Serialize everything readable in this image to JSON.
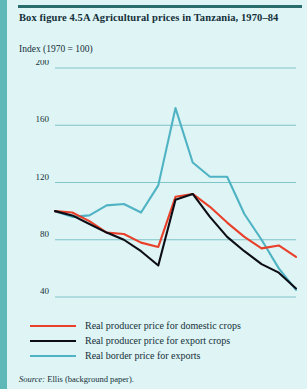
{
  "figure": {
    "title": "Box figure 4.5A  Agricultural prices in Tanzania, 1970–84",
    "axis_note": "Index (1970 = 100)",
    "source_label": "Source:",
    "source_text": " Ellis (background paper)."
  },
  "colors": {
    "background": "#dff4f4",
    "left_bar": "#5fb8b8",
    "top_rule": "#2a6b6b",
    "grid": "#7fc4c9",
    "domestic": "#e8402a",
    "export": "#0d0d16",
    "border": "#4fb3c4",
    "text": "#14303a"
  },
  "legend": {
    "position": "below-axis",
    "items": [
      {
        "label": "Real producer price for domestic crops",
        "color": "#e8402a",
        "key": "domestic"
      },
      {
        "label": "Real producer price for export crops",
        "color": "#0d0d16",
        "key": "export"
      },
      {
        "label": "Real border price for exports",
        "color": "#4fb3c4",
        "key": "border"
      }
    ]
  },
  "chart_data": {
    "type": "line",
    "title": "Box figure 4.5A  Agricultural prices in Tanzania, 1970–84",
    "xlabel": "",
    "ylabel": "Index (1970 = 100)",
    "xlim": [
      1970,
      1984
    ],
    "ylim": [
      40,
      200
    ],
    "grid": true,
    "yticks": [
      40,
      80,
      120,
      160,
      200
    ],
    "ytick_labels": [
      "40",
      "80",
      "120",
      "160",
      "200"
    ],
    "xticks": [
      1970,
      1975,
      1980,
      1984
    ],
    "xtick_labels": [
      "1970",
      "1975",
      "1980",
      "1984"
    ],
    "x": [
      1970,
      1971,
      1972,
      1973,
      1974,
      1975,
      1976,
      1977,
      1978,
      1979,
      1980,
      1981,
      1982,
      1983,
      1984
    ],
    "series": [
      {
        "name": "Real producer price for domestic crops",
        "color": "#e8402a",
        "values": [
          100,
          99,
          93,
          85,
          84,
          78,
          75,
          110,
          112,
          103,
          92,
          82,
          74,
          76,
          68
        ]
      },
      {
        "name": "Real producer price for export crops",
        "color": "#0d0d16",
        "values": [
          100,
          97,
          91,
          85,
          80,
          72,
          62,
          108,
          112,
          96,
          82,
          72,
          63,
          57,
          46
        ]
      },
      {
        "name": "Real border price for exports",
        "color": "#4fb3c4",
        "values": [
          100,
          96,
          97,
          104,
          105,
          99,
          118,
          172,
          134,
          124,
          124,
          98,
          80,
          60,
          45
        ]
      }
    ]
  }
}
